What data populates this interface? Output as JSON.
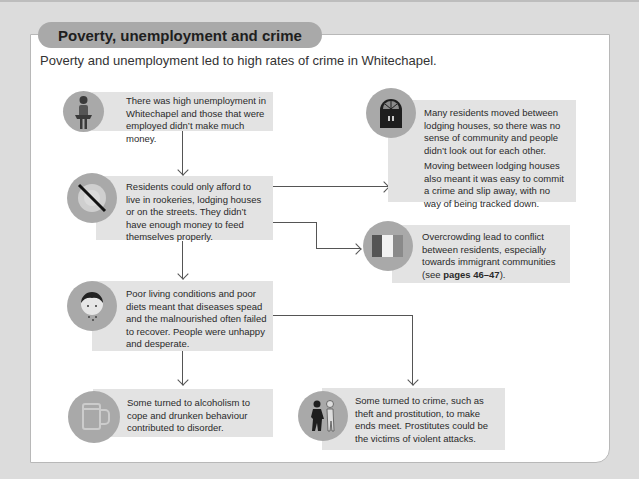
{
  "section": {
    "title": "Poverty, unemployment and crime",
    "intro": "Poverty and unemployment led to high rates of crime in Whitechapel."
  },
  "flow": {
    "unemployment": {
      "icon": "person-empty-pockets-icon",
      "text": "There was high unemployment in Whitechapel and those that were employed didn’t make much money."
    },
    "housing": {
      "icon": "no-food-plate-icon",
      "text": "Residents could only afford to live in rookeries, lodging houses or on the streets. They didn’t have enough money to feed themselves properly."
    },
    "community": {
      "icon": "door-icon",
      "text_1": "Many residents moved between lodging houses, so there was no sense of community and people didn’t look out for each other.",
      "text_2": "Moving between lodging houses also meant it was easy to commit a crime and slip away, with no way of being tracked down."
    },
    "conflict": {
      "icon": "flag-icon",
      "text_before": "Overcrowding lead to conflict between residents, especially towards immigrant communities (see ",
      "pages": "pages 46–47",
      "text_after": ")."
    },
    "disease": {
      "icon": "sick-person-icon",
      "text": "Poor living conditions and poor diets meant that diseases spead and the malnourished often failed to recover. People were unhappy and desperate."
    },
    "alcohol": {
      "icon": "beer-mug-icon",
      "text": "Some turned to alcoholism to cope and drunken behaviour contributed to disorder."
    },
    "crime": {
      "icon": "criminal-figures-icon",
      "text": "Some turned to crime, such as theft and prostitution, to make ends meet. Prostitutes could be the victims of violent attacks."
    }
  },
  "colors": {
    "background": "#dcdcdc",
    "panel": "#ffffff",
    "box": "#e3e3e3",
    "icon_circle": "#a9a9a9",
    "connector": "#555555"
  }
}
